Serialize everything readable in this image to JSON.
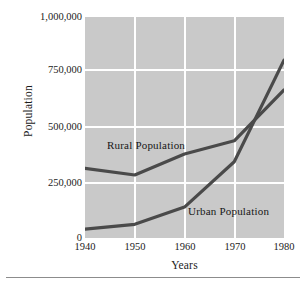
{
  "chart_data": {
    "type": "line",
    "title": "",
    "xlabel": "Years",
    "ylabel": "Population",
    "x": [
      1940,
      1950,
      1960,
      1970,
      1980
    ],
    "xtick_labels": [
      "1940",
      "1950",
      "1960",
      "1970",
      "1980"
    ],
    "ytick_labels": [
      "1,000,000",
      "750,000",
      "500,000",
      "250,000",
      "0"
    ],
    "ytick_values": [
      1000000,
      750000,
      500000,
      250000,
      0
    ],
    "xlim": [
      1940,
      1980
    ],
    "ylim": [
      0,
      1000000
    ],
    "grid": true,
    "legend_position": "inline-annotations",
    "plot_background": "#c9c9c9",
    "gridline_color": "#ffffff",
    "line_color": "#4a4a4a",
    "series": [
      {
        "name": "Rural Population",
        "values": [
          315000,
          285000,
          380000,
          440000,
          670000
        ]
      },
      {
        "name": "Urban Population",
        "values": [
          40000,
          62000,
          140000,
          345000,
          805000
        ]
      }
    ],
    "annotations": [
      {
        "text": "Rural Population",
        "x": 1944.5,
        "y": 455000
      },
      {
        "text": "Urban Population",
        "x": 1961.0,
        "y": 155000
      }
    ]
  }
}
